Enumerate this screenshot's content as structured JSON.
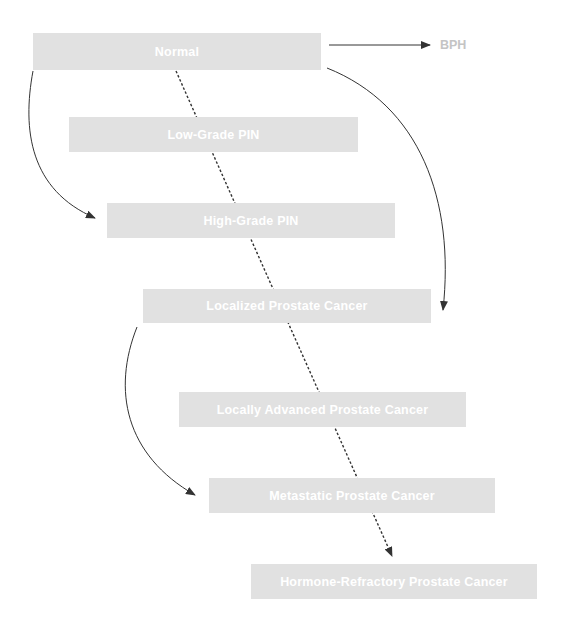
{
  "diagram": {
    "colors": {
      "node_fill": "#e1e1e1",
      "node_text": "#ffffff",
      "side_label": "#c4c4c4",
      "arrow": "#333333"
    },
    "nodes": [
      {
        "id": "normal",
        "label": "Normal"
      },
      {
        "id": "low_grade_pin",
        "label": "Low-Grade PIN"
      },
      {
        "id": "high_grade_pin",
        "label": "High-Grade PIN"
      },
      {
        "id": "localized",
        "label": "Localized Prostate Cancer"
      },
      {
        "id": "locally_advanced",
        "label": "Locally Advanced Prostate Cancer"
      },
      {
        "id": "metastatic",
        "label": "Metastatic Prostate Cancer"
      },
      {
        "id": "hormone_refractory",
        "label": "Hormone-Refractory Prostate Cancer"
      }
    ],
    "side_label": {
      "id": "bph",
      "label": "BPH"
    },
    "edges": [
      {
        "from": "normal",
        "to": "bph",
        "style": "solid"
      },
      {
        "from": "normal",
        "to": "high_grade_pin",
        "style": "solid-curved"
      },
      {
        "from": "normal",
        "to": "localized",
        "style": "solid-curved"
      },
      {
        "from": "localized",
        "to": "metastatic",
        "style": "solid-curved"
      },
      {
        "from": "normal",
        "to": "hormone_refractory",
        "style": "dashed"
      }
    ]
  }
}
